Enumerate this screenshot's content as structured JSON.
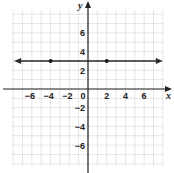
{
  "chart_data": {
    "type": "line",
    "title": "",
    "xlabel": "x",
    "ylabel": "y",
    "xlim": [
      -8,
      8
    ],
    "ylim": [
      -8,
      8.5
    ],
    "grid": true,
    "grid_step": 1,
    "x_ticks": [
      -6,
      -4,
      -2,
      0,
      2,
      4,
      6
    ],
    "y_ticks": [
      6,
      4,
      2,
      -2,
      -4,
      -6
    ],
    "x_tick_labels": [
      "−6",
      "−4",
      "−2",
      "0",
      "2",
      "4",
      "6"
    ],
    "y_tick_labels": [
      "6",
      "4",
      "2",
      "−2",
      "−4",
      "−6"
    ],
    "series": [
      {
        "name": "y = 3",
        "kind": "horizontal line with arrows at both ends",
        "equation": "y = 3",
        "points": [
          {
            "x": -4,
            "y": 3
          },
          {
            "x": 2,
            "y": 3
          }
        ],
        "extent_x": [
          -7.9,
          8.0
        ]
      }
    ],
    "legend": null
  },
  "labels": {
    "x_axis": "x",
    "y_axis": "y"
  },
  "colors": {
    "grid": "#d4d4d4",
    "axis": "#222222",
    "line": "#2a2a2a",
    "background": "#ffffff"
  }
}
